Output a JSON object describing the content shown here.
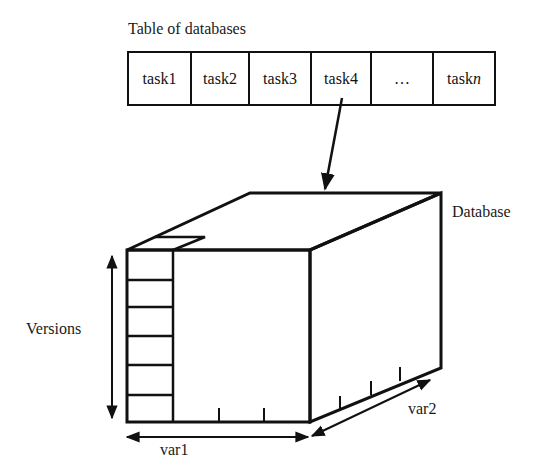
{
  "title": "Table of databases",
  "table": {
    "cells": [
      {
        "label": "task1",
        "width": 63
      },
      {
        "label": "task2",
        "width": 58
      },
      {
        "label": "task3",
        "width": 62
      },
      {
        "label": "task4",
        "width": 60
      },
      {
        "label": "…",
        "width": 62
      },
      {
        "label": "task",
        "suffix": "n",
        "width": 60
      }
    ]
  },
  "database_label": "Database",
  "axes": {
    "versions": "Versions",
    "var1": "var1",
    "var2": "var2"
  },
  "colors": {
    "line": "#111111",
    "background": "#ffffff"
  }
}
